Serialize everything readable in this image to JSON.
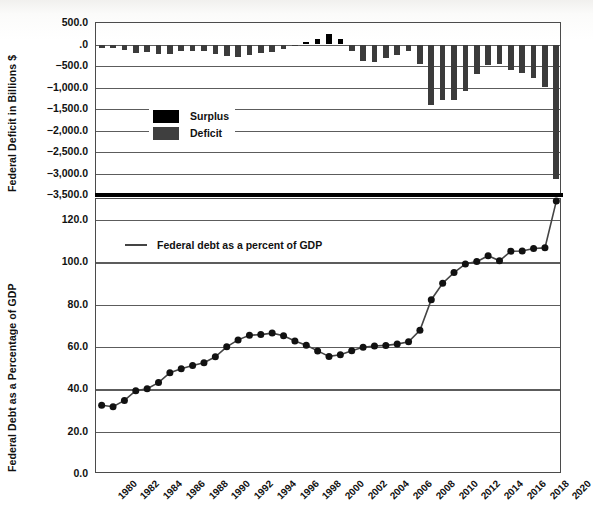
{
  "figure": {
    "title": "",
    "background_color": "#ffffff",
    "bar_deficit_color": "#3b3b3b",
    "bar_surplus_color": "#000000",
    "line_color": "#444444",
    "grid_color": "#5c5c5c",
    "frame_color": "#4b4b4b"
  },
  "top_chart": {
    "ylabel": "Federal Deficit in Billions $",
    "yticks": [
      "500.0",
      ".0",
      "−500.0",
      "−1,000.0",
      "−1,500.0",
      "−2,000.0",
      "−2,500.0",
      "−3,000.0",
      "−3,500.0"
    ],
    "legend": [
      {
        "label": "Surplus",
        "color": "#000000"
      },
      {
        "label": "Deficit",
        "color": "#3f3f3f"
      }
    ]
  },
  "bottom_chart": {
    "ylabel": "Federal Debt as a Percentage of GDP",
    "yticks": [
      "120.0",
      "100.0",
      "80.0",
      "60.0",
      "40.0",
      "20.0",
      "0.0"
    ],
    "legend": [
      {
        "label": "Federal debt as a percent of GDP",
        "color": "#444444"
      }
    ]
  },
  "xaxis": {
    "tick_labels": [
      "1980",
      "1982",
      "1984",
      "1986",
      "1988",
      "1990",
      "1992",
      "1994",
      "1996",
      "1998",
      "2000",
      "2002",
      "2004",
      "2006",
      "2008",
      "2010",
      "2012",
      "2014",
      "2016",
      "2018",
      "2020"
    ]
  },
  "chart_data": [
    {
      "type": "bar",
      "title": "Federal Deficit in Billions $",
      "xlabel": "",
      "ylabel": "Federal Deficit in Billions $",
      "ylim": [
        -3500,
        500
      ],
      "grid": true,
      "legend_position": "center-left",
      "legend_entries": [
        "Surplus",
        "Deficit"
      ],
      "categories": [
        1980,
        1981,
        1982,
        1983,
        1984,
        1985,
        1986,
        1987,
        1988,
        1989,
        1990,
        1991,
        1992,
        1993,
        1994,
        1995,
        1996,
        1997,
        1998,
        1999,
        2000,
        2001,
        2002,
        2003,
        2004,
        2005,
        2006,
        2007,
        2008,
        2009,
        2010,
        2011,
        2012,
        2013,
        2014,
        2015,
        2016,
        2017,
        2018,
        2019,
        2020
      ],
      "values": [
        -74,
        -79,
        -128,
        -208,
        -185,
        -212,
        -221,
        -150,
        -155,
        -153,
        -221,
        -269,
        -290,
        -255,
        -203,
        -164,
        -107,
        -22,
        69,
        126,
        236,
        128,
        -158,
        -378,
        -413,
        -318,
        -248,
        -161,
        -459,
        -1413,
        -1294,
        -1300,
        -1087,
        -680,
        -485,
        -442,
        -585,
        -665,
        -779,
        -984,
        -3132
      ],
      "series": [
        {
          "name": "Surplus",
          "values": [
            null,
            null,
            null,
            null,
            null,
            null,
            null,
            null,
            null,
            null,
            null,
            null,
            null,
            null,
            null,
            null,
            null,
            null,
            69,
            126,
            236,
            128,
            null,
            null,
            null,
            null,
            null,
            null,
            null,
            null,
            null,
            null,
            null,
            null,
            null,
            null,
            null,
            null,
            null,
            null,
            null
          ]
        },
        {
          "name": "Deficit",
          "values": [
            -74,
            -79,
            -128,
            -208,
            -185,
            -212,
            -221,
            -150,
            -155,
            -153,
            -221,
            -269,
            -290,
            -255,
            -203,
            -164,
            -107,
            -22,
            null,
            null,
            null,
            null,
            -158,
            -378,
            -413,
            -318,
            -248,
            -161,
            -459,
            -1413,
            -1294,
            -1300,
            -1087,
            -680,
            -485,
            -442,
            -585,
            -665,
            -779,
            -984,
            -3132
          ]
        }
      ]
    },
    {
      "type": "line",
      "title": "Federal Debt as a Percentage of GDP",
      "xlabel": "",
      "ylabel": "Federal Debt as a Percentage of GDP",
      "ylim": [
        0,
        130
      ],
      "grid": true,
      "legend_position": "top-left",
      "legend_entries": [
        "Federal debt as a percent of GDP"
      ],
      "x": [
        1980,
        1981,
        1982,
        1983,
        1984,
        1985,
        1986,
        1987,
        1988,
        1989,
        1990,
        1991,
        1992,
        1993,
        1994,
        1995,
        1996,
        1997,
        1998,
        1999,
        2000,
        2001,
        2002,
        2003,
        2004,
        2005,
        2006,
        2007,
        2008,
        2009,
        2010,
        2011,
        2012,
        2013,
        2014,
        2015,
        2016,
        2017,
        2018,
        2019,
        2020
      ],
      "values": [
        32.5,
        31.8,
        34.8,
        39.4,
        40.3,
        43.2,
        47.9,
        49.8,
        51.3,
        52.6,
        55.4,
        60.1,
        63.4,
        65.6,
        65.9,
        66.6,
        65.4,
        62.9,
        60.9,
        58.2,
        55.6,
        56.4,
        58.3,
        59.9,
        60.5,
        60.8,
        61.4,
        62.5,
        67.9,
        82.4,
        90.2,
        95.2,
        99.3,
        100.4,
        103.2,
        100.8,
        105.3,
        105.4,
        106.6,
        106.9,
        129.0
      ]
    }
  ]
}
